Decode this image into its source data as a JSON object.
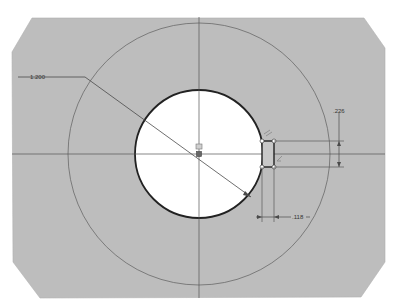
{
  "drawing": {
    "colors": {
      "background": "#ffffff",
      "plate_fill": "#bdbdbd",
      "hole_fill": "#ffffff",
      "hole_stroke": "#222222",
      "geometry_line": "#6a6a6a",
      "dimension_line": "#4a4a4a"
    },
    "dimensions": {
      "diameter_label": "1.200",
      "height_label": ".226",
      "width_label": ".118"
    },
    "constraint_glyphs": {
      "center_marker": "concentric-icon",
      "keyway_top": "parallel-icon",
      "keyway_bottom": "perpendicular-icon"
    }
  }
}
